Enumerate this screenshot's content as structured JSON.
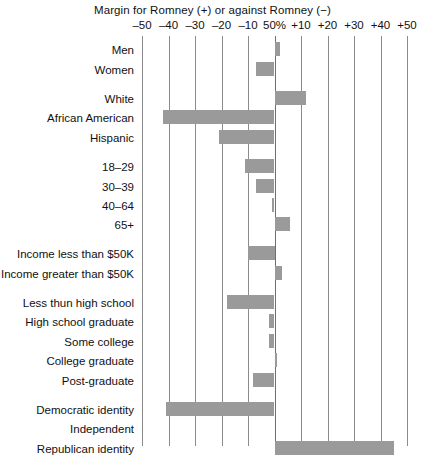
{
  "chart_data": {
    "type": "bar",
    "orientation": "horizontal",
    "title": "Margin for Romney (+) or against Romney (−)",
    "xlabel": "",
    "ylabel": "",
    "xlim": [
      -50,
      50
    ],
    "grid": true,
    "legend": null,
    "center_tick_label": "50%",
    "xticks": [
      -50,
      -40,
      -30,
      -20,
      -10,
      0,
      10,
      20,
      30,
      40,
      50
    ],
    "xtick_labels": [
      "–50",
      "–40",
      "–30",
      "–20",
      "–10",
      "50%",
      "+10",
      "+20",
      "+30",
      "+40",
      "+50"
    ],
    "bar_color": "#9a9a9a",
    "gridline_color": "#8c8c8c",
    "categories": [
      "Men",
      "Women",
      "White",
      "African American",
      "Hispanic",
      "18–29",
      "30–39",
      "40–64",
      "65+",
      "Income less than $50K",
      "Income greater than $50K",
      "Less thun high school",
      "High school graduate",
      "Some college",
      "College graduate",
      "Post-graduate",
      "Democratic identity",
      "Independent",
      "Republican identity"
    ],
    "values": [
      2,
      -7,
      12,
      -42,
      -21,
      -11,
      -7,
      -1,
      6,
      -10,
      3,
      -18,
      -2,
      -2,
      1,
      -8,
      -41,
      0,
      45
    ],
    "groups": [
      {
        "name": "gender",
        "categories": [
          "Men",
          "Women"
        ]
      },
      {
        "name": "race",
        "categories": [
          "White",
          "African American",
          "Hispanic"
        ]
      },
      {
        "name": "age",
        "categories": [
          "18–29",
          "30–39",
          "40–64",
          "65+"
        ]
      },
      {
        "name": "income",
        "categories": [
          "Income less than $50K",
          "Income greater than $50K"
        ]
      },
      {
        "name": "education",
        "categories": [
          "Less thun high school",
          "High school graduate",
          "Some college",
          "College graduate",
          "Post-graduate"
        ]
      },
      {
        "name": "party",
        "categories": [
          "Democratic identity",
          "Independent",
          "Republican identity"
        ]
      }
    ]
  },
  "rows": [
    {
      "label": "Men",
      "value": 2,
      "y": 8
    },
    {
      "label": "Women",
      "value": -7,
      "y": 28
    },
    {
      "label": "White",
      "value": 12,
      "y": 57
    },
    {
      "label": "African American",
      "value": -42,
      "y": 76
    },
    {
      "label": "Hispanic",
      "value": -21,
      "y": 96
    },
    {
      "label": "18–29",
      "value": -11,
      "y": 125
    },
    {
      "label": "30–39",
      "value": -7,
      "y": 145
    },
    {
      "label": "40–64",
      "value": -1,
      "y": 164
    },
    {
      "label": "65+",
      "value": 6,
      "y": 183
    },
    {
      "label": "Income less than $50K",
      "value": -10,
      "y": 212
    },
    {
      "label": "Income greater than $50K",
      "value": 3,
      "y": 232
    },
    {
      "label": "Less thun high school",
      "value": -18,
      "y": 261
    },
    {
      "label": "High school graduate",
      "value": -2,
      "y": 280
    },
    {
      "label": "Some college",
      "value": -2,
      "y": 300
    },
    {
      "label": "College graduate",
      "value": 1,
      "y": 319
    },
    {
      "label": "Post-graduate",
      "value": -8,
      "y": 339
    },
    {
      "label": "Democratic identity",
      "value": -41,
      "y": 368
    },
    {
      "label": "Independent",
      "value": 0,
      "y": 387
    },
    {
      "label": "Republican identity",
      "value": 45,
      "y": 407
    }
  ]
}
